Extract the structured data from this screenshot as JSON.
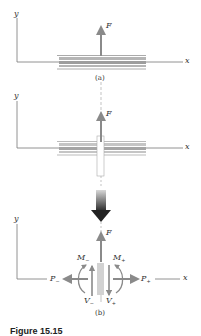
{
  "diagram": {
    "panel_a": {
      "axis_y_label": "y",
      "axis_x_label": "x",
      "force_label": "F",
      "caption": "(a)"
    },
    "panel_mid": {
      "axis_y_label": "y",
      "axis_x_label": "x",
      "force_label": "F"
    },
    "panel_b": {
      "axis_y_label": "y",
      "axis_x_label": "x",
      "force_label": "F",
      "moment_left": {
        "main": "M",
        "sub": "−"
      },
      "moment_right": {
        "main": "M",
        "sub": "+"
      },
      "axial_left": {
        "main": "P",
        "sub": "−"
      },
      "axial_right": {
        "main": "P",
        "sub": "+"
      },
      "shear_left": {
        "main": "V",
        "sub": "−"
      },
      "shear_right": {
        "main": "V",
        "sub": "+"
      },
      "caption": "(b)"
    },
    "figure_caption": "Figure 15.15",
    "colors": {
      "axis": "#666666",
      "arrow": "#8a8a8a",
      "plate": "#9a9a9a",
      "big_arrow": "#333333"
    }
  }
}
